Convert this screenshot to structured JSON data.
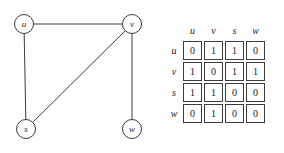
{
  "graph": {
    "nodes": [
      {
        "id": "u",
        "label": "u"
      },
      {
        "id": "v",
        "label": "v"
      },
      {
        "id": "s",
        "label": "s"
      },
      {
        "id": "w",
        "label": "w"
      }
    ],
    "edges": [
      {
        "from": "u",
        "to": "v"
      },
      {
        "from": "u",
        "to": "s"
      },
      {
        "from": "v",
        "to": "s"
      },
      {
        "from": "v",
        "to": "w"
      }
    ]
  },
  "matrix": {
    "col_headers": [
      "u",
      "v",
      "s",
      "w"
    ],
    "row_headers": [
      "u",
      "v",
      "s",
      "w"
    ],
    "rows": [
      [
        0,
        1,
        1,
        0
      ],
      [
        1,
        0,
        1,
        1
      ],
      [
        1,
        1,
        0,
        0
      ],
      [
        0,
        1,
        0,
        0
      ]
    ]
  },
  "colors": {
    "line": "#3c3c3c",
    "background": "#fefefe",
    "text": "#1d1d1d"
  }
}
